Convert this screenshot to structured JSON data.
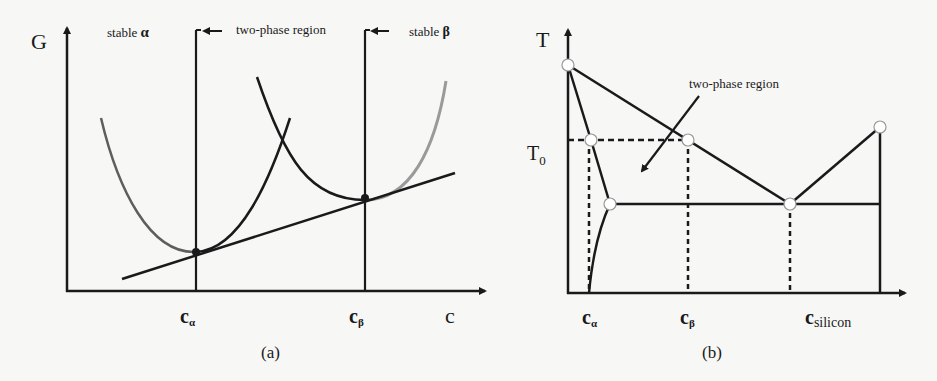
{
  "panel_a": {
    "y_axis_label": "G",
    "x_axis_label": "c",
    "region_labels": {
      "stable_alpha": "stable",
      "stable_alpha_symbol": "α",
      "two_phase": "two-phase region",
      "stable_beta": "stable",
      "stable_beta_symbol": "β"
    },
    "tick_labels": {
      "c_alpha_main": "c",
      "c_alpha_sub": "α",
      "c_beta_main": "c",
      "c_beta_sub": "β"
    },
    "caption": "(a)"
  },
  "panel_b": {
    "y_axis_label": "T",
    "t0_main": "T",
    "t0_sub": "0",
    "annotation": "two-phase region",
    "tick_labels": {
      "c_alpha_main": "c",
      "c_alpha_sub": "α",
      "c_beta_main": "c",
      "c_beta_sub": "β",
      "c_silicon_main": "c",
      "c_silicon_sub": "silicon"
    },
    "caption": "(b)"
  },
  "colors": {
    "line": "#1a1a1a",
    "gray_curve": "#6a6a6a",
    "light_gray_curve": "#9a9a9a",
    "background": "#f7f7f6"
  }
}
